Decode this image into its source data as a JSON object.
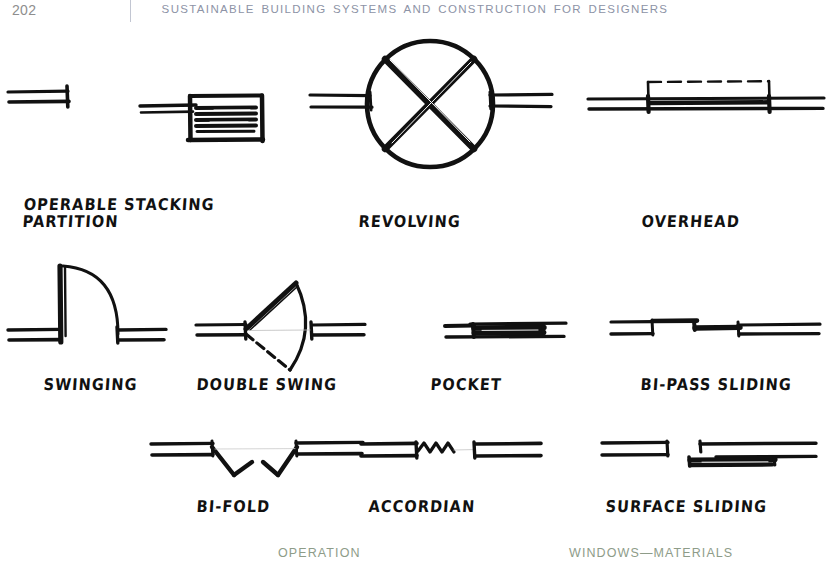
{
  "page": {
    "folio": "202",
    "running_head": "SUSTAINABLE BUILDING SYSTEMS AND CONSTRUCTION FOR DESIGNERS",
    "background_color": "#ffffff",
    "header_color": "#8d93a6",
    "folio_color": "#8e8e8e",
    "ink_color": "#111111",
    "footer_color": "#8e9c89"
  },
  "figures": [
    {
      "id": "operable-stacking-partition",
      "caption_line1": "OPERABLE STACKING",
      "caption_line2": "PARTITION",
      "symbol": "stacked-panel-partition-plan"
    },
    {
      "id": "revolving",
      "caption_line1": "REVOLVING",
      "caption_line2": "",
      "symbol": "revolving-door-plan"
    },
    {
      "id": "overhead",
      "caption_line1": "OVERHEAD",
      "caption_line2": "",
      "symbol": "overhead-door-plan"
    },
    {
      "id": "swinging",
      "caption_line1": "SWINGING",
      "caption_line2": "",
      "symbol": "single-swing-door-plan"
    },
    {
      "id": "double-swing",
      "caption_line1": "DOUBLE SWING",
      "caption_line2": "",
      "symbol": "double-acting-door-plan"
    },
    {
      "id": "pocket",
      "caption_line1": "POCKET",
      "caption_line2": "",
      "symbol": "pocket-door-plan"
    },
    {
      "id": "bi-pass-sliding",
      "caption_line1": "BI-PASS SLIDING",
      "caption_line2": "",
      "symbol": "bypass-sliding-door-plan"
    },
    {
      "id": "bi-fold",
      "caption_line1": "BI-FOLD",
      "caption_line2": "",
      "symbol": "bifold-door-plan"
    },
    {
      "id": "accordian",
      "caption_line1": "ACCORDIAN",
      "caption_line2": "",
      "symbol": "accordion-door-plan"
    },
    {
      "id": "surface-sliding",
      "caption_line1": "SURFACE SLIDING",
      "caption_line2": "",
      "symbol": "surface-sliding-door-plan"
    }
  ],
  "footer": {
    "left_label": "OPERATION",
    "right_label": "WINDOWS—MATERIALS"
  }
}
